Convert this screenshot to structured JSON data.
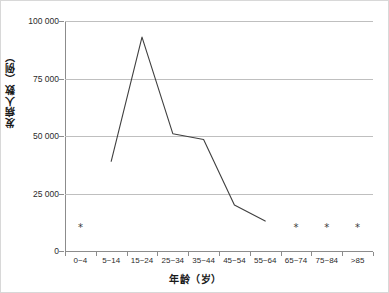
{
  "chart_data": {
    "type": "line",
    "title": "",
    "xlabel": "年龄（岁）",
    "ylabel": "发病人数（例）",
    "categories": [
      "0~4",
      "5~14",
      "15~24",
      "25~34",
      "35~44",
      "45~54",
      "55~64",
      "65~74",
      "75~84",
      ">85"
    ],
    "series": [
      {
        "name": "发病人数",
        "values": [
          null,
          39000,
          93000,
          51000,
          48500,
          20000,
          13000,
          null,
          null,
          null
        ]
      }
    ],
    "markers": {
      "symbol": "*",
      "categories": [
        "0~4",
        "65~74",
        "75~84",
        ">85"
      ],
      "value": 10000,
      "note": "星号标记"
    },
    "ylim": [
      0,
      100000
    ],
    "ytick_values": [
      0,
      25000,
      50000,
      75000,
      100000
    ],
    "ytick_labels": [
      "0",
      "25 000",
      "50 000",
      "75 000",
      "100 000"
    ],
    "grid": true,
    "legend": "none",
    "line_color": "#3f3f3f",
    "grid_color": "#bfbfbf",
    "axis_color": "#8c8c8c"
  }
}
